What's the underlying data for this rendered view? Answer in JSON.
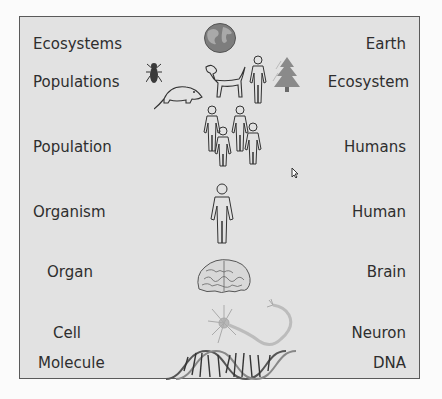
{
  "diagram": {
    "levels": [
      {
        "level": "Ecosystems",
        "example": "Earth",
        "image": "globe-icon"
      },
      {
        "level": "Populations",
        "example": "Ecosystem",
        "image": "animals-and-tree-icon"
      },
      {
        "level": "Population",
        "example": "Humans",
        "image": "group-of-people-icon"
      },
      {
        "level": "Organism",
        "example": "Human",
        "image": "human-figure-icon"
      },
      {
        "level": "Organ",
        "example": "Brain",
        "image": "brain-icon"
      },
      {
        "level": "Cell",
        "example": "Neuron",
        "image": "neuron-icon"
      },
      {
        "level": "Molecule",
        "example": "DNA",
        "image": "dna-helix-icon"
      }
    ]
  },
  "colors": {
    "background": "#e2e2e2",
    "border": "#5a5a5a",
    "text": "#2e2e2e",
    "page": "#fbfbfb"
  }
}
